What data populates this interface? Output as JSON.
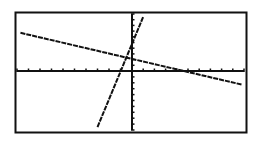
{
  "chart_data": {
    "type": "line",
    "title": "",
    "xlabel": "",
    "ylabel": "",
    "grid": false,
    "legend": "none",
    "xlim": [
      -10,
      10
    ],
    "ylim": [
      -10,
      10
    ],
    "axis_ticks": {
      "x_step": 1,
      "y_step": 1
    },
    "series": [
      {
        "name": "line-shallow",
        "x": [
          -9.7,
          9.8
        ],
        "y": [
          6.7,
          -2.3
        ]
      },
      {
        "name": "line-steep",
        "x": [
          -3.0,
          1.0
        ],
        "y": [
          -9.5,
          9.5
        ]
      }
    ]
  },
  "colors": {
    "line": "#111111",
    "frame": "#111111",
    "background": "#ffffff"
  },
  "frame_px": {
    "left": 15,
    "top": 12,
    "right": 246,
    "bottom": 132
  }
}
